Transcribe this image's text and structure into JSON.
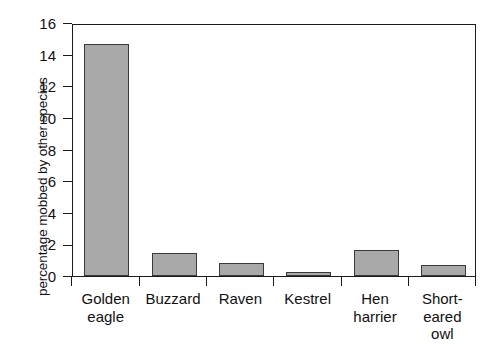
{
  "chart_data": {
    "type": "bar",
    "title": "",
    "subtitle": "",
    "xlabel": "",
    "ylabel": "percentage mobbed by other species",
    "categories": [
      "Golden\neagle",
      "Buzzard",
      "Raven",
      "Kestrel",
      "Hen\nharrier",
      "Short-\neared\nowl"
    ],
    "values": [
      14.7,
      1.45,
      0.85,
      0.25,
      1.65,
      0.7
    ],
    "ylim": [
      0,
      16
    ],
    "ytick_labels": [
      "0",
      "2",
      "4",
      "6",
      "8",
      "10",
      "12",
      "14",
      "16"
    ],
    "ytick_values": [
      0,
      2,
      4,
      6,
      8,
      10,
      12,
      14,
      16
    ],
    "grid": false,
    "legend": false,
    "legend_position": "none",
    "bar_fill_color": "#a9a9a9",
    "bar_edge_color": "#3a3a3a",
    "axis_color": "#1b1b1b",
    "background_color": "#ffffff"
  }
}
